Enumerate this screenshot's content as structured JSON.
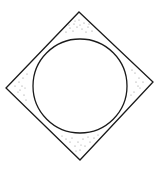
{
  "diagram": {
    "title": "",
    "shapes": {
      "diamond": {
        "points": [
          [
            79,
            12
          ],
          [
            153,
            82
          ],
          [
            80,
            160
          ],
          [
            6,
            88
          ]
        ],
        "stroke": "#1a1a1a",
        "stroke_width": 1.3
      },
      "circle": {
        "cx": 80,
        "cy": 86,
        "r": 47,
        "stroke": "#1a1a1a",
        "stroke_width": 1.3
      },
      "stipple_color": "#7a7a7a"
    }
  }
}
